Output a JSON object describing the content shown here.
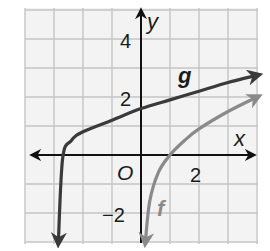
{
  "chart_data": {
    "type": "line",
    "title": "",
    "xlabel": "x",
    "ylabel": "y",
    "origin_label": "O",
    "xlim": [
      -4,
      4
    ],
    "ylim": [
      -3,
      5
    ],
    "grid": true,
    "x_tick_labels": [
      {
        "value": 2,
        "label": "2"
      }
    ],
    "y_tick_labels": [
      {
        "value": 4,
        "label": "4"
      },
      {
        "value": 2,
        "label": "2"
      },
      {
        "value": -2,
        "label": "−2"
      }
    ],
    "series": [
      {
        "name": "g",
        "color": "#3a3a3a",
        "description": "Logarithmic curve, vertical asymptote near x = -3, crosses x-axis near x = -2.7, passes y-intercept ~1.6",
        "x": [
          -2.85,
          -2.7,
          -2.4,
          -2,
          -1,
          0,
          1,
          2,
          3,
          4
        ],
        "y": [
          -3,
          -0.1,
          0.5,
          0.8,
          1.2,
          1.6,
          1.9,
          2.2,
          2.5,
          2.75
        ]
      },
      {
        "name": "f",
        "color": "#8a8a8a",
        "description": "Logarithmic curve, vertical asymptote near x = 0, crosses x-axis at x = 1",
        "x": [
          0.15,
          0.3,
          0.6,
          1,
          1.5,
          2,
          3,
          4
        ],
        "y": [
          -3,
          -1.6,
          -0.6,
          0,
          0.5,
          0.9,
          1.5,
          2
        ]
      }
    ],
    "annotations": [
      {
        "text": "g",
        "x": 1.5,
        "y": 2.7
      },
      {
        "text": "f",
        "x": 0.5,
        "y": -1.8
      }
    ]
  }
}
